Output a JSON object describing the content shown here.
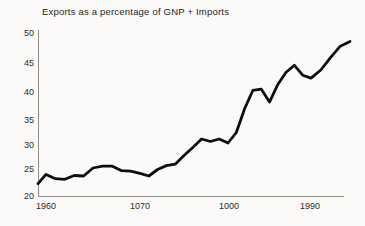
{
  "chart_data": {
    "type": "line",
    "title": "Exports as a percentage of GNP + Imports",
    "xlabel": "",
    "ylabel": "",
    "ylim": [
      20,
      50
    ],
    "grid": false,
    "legend": false,
    "y_tick_labels": [
      "50",
      "45",
      "40",
      "35",
      "30",
      "25",
      "20"
    ],
    "x_tick_labels": [
      "1960",
      "1070",
      "1000",
      "1990"
    ],
    "line_color": "#0d0d0d",
    "axis_color": "#8f8d8a",
    "background": "#fbfaf8",
    "series": [
      {
        "name": "Exports as a percentage of GNP + Imports",
        "x": [
          1959,
          1960,
          1961,
          1962,
          1963,
          1964,
          1965,
          1966,
          1967,
          1968,
          1969,
          1970,
          1971,
          1972,
          1973,
          1974,
          1975,
          1976,
          1977,
          1978,
          1979,
          1980,
          1981,
          1982,
          1983,
          1984,
          1985,
          1986,
          1987,
          1988,
          1989,
          1990,
          1991,
          1992,
          1993,
          1994
        ],
        "values": [
          22.3,
          24.0,
          23.2,
          23.1,
          23.8,
          23.7,
          25.2,
          25.6,
          25.6,
          24.7,
          24.6,
          24.2,
          23.7,
          24.9,
          25.7,
          26.0,
          27.8,
          29.5,
          31.2,
          30.7,
          31.2,
          30.4,
          32.5,
          37.0,
          40.3,
          40.5,
          38.2,
          41.3,
          43.4,
          44.6,
          42.9,
          42.4,
          43.8,
          45.9,
          47.8,
          48.6
        ]
      }
    ]
  }
}
